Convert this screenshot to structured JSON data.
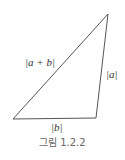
{
  "figure": {
    "caption": "그림 1.2.2",
    "labels": {
      "hypotenuse": "|a + b|",
      "right_side": "|a|",
      "bottom_side": "|b|"
    },
    "triangle": {
      "vertices": {
        "top": [
          108,
          14
        ],
        "bottom_left": [
          13,
          119
        ],
        "bottom_right": [
          96,
          118
        ]
      },
      "stroke_color": "#555555"
    }
  }
}
